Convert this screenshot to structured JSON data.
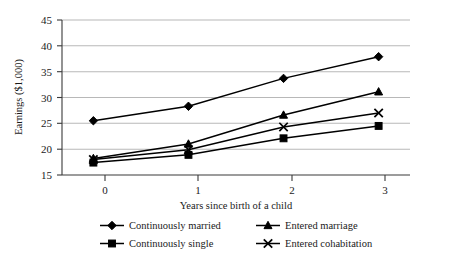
{
  "chart_data": {
    "type": "line",
    "title": "",
    "xlabel": "Years since birth of a child",
    "ylabel": "Earnings ($1,000)",
    "x": [
      0,
      1,
      2,
      3
    ],
    "xticklabels": [
      "0",
      "1",
      "2",
      "3"
    ],
    "yticklabels": [
      "15",
      "20",
      "25",
      "30",
      "35",
      "40",
      "45"
    ],
    "yticks": [
      15,
      20,
      25,
      30,
      35,
      40,
      45
    ],
    "ylim": [
      15,
      45
    ],
    "xlim": [
      -0.33,
      3.33
    ],
    "grid": "horizontal",
    "legend_position": "bottom",
    "series": [
      {
        "name": "Continuously married",
        "marker": "diamond",
        "values": [
          25.5,
          28.3,
          33.7,
          37.9
        ]
      },
      {
        "name": "Entered marriage",
        "marker": "triangle",
        "values": [
          18.2,
          21.0,
          26.6,
          31.1
        ]
      },
      {
        "name": "Continuously single",
        "marker": "square",
        "values": [
          17.4,
          18.9,
          22.1,
          24.5
        ]
      },
      {
        "name": "Entered cohabitation",
        "marker": "x",
        "values": [
          18.0,
          19.9,
          24.3,
          27.0
        ]
      }
    ],
    "colors": {
      "line": "#000000",
      "grid": "#b8b8b8",
      "axis": "#3a3a3a",
      "background": "#ffffff"
    }
  },
  "axes": {
    "y_title": "Earnings ($1,000)",
    "x_title": "Years since birth of a child",
    "y_tick_0": "15",
    "y_tick_1": "20",
    "y_tick_2": "25",
    "y_tick_3": "30",
    "y_tick_4": "35",
    "y_tick_5": "40",
    "y_tick_6": "45",
    "x_tick_0": "0",
    "x_tick_1": "1",
    "x_tick_2": "2",
    "x_tick_3": "3"
  },
  "legend": {
    "items": [
      {
        "label": "Continuously married",
        "marker": "diamond"
      },
      {
        "label": "Entered marriage",
        "marker": "triangle"
      },
      {
        "label": "Continuously single",
        "marker": "square"
      },
      {
        "label": "Entered cohabitation",
        "marker": "x"
      }
    ]
  }
}
